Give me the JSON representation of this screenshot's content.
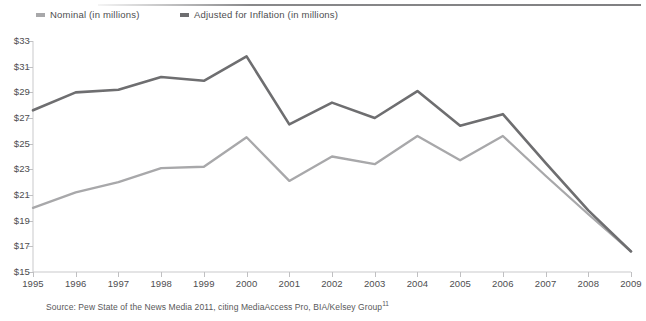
{
  "legend": {
    "items": [
      {
        "label": "Nominal (in millions)",
        "color": "#a8a8aa",
        "key": "nominal"
      },
      {
        "label": "Adjusted for Inflation (in millions)",
        "color": "#6e6e70",
        "key": "adjusted"
      }
    ]
  },
  "source": {
    "text": "Source: Pew State of the News Media 2011, citing MediaAccess Pro, BIA/Kelsey Group",
    "footnote_marker": "11"
  },
  "chart_data": {
    "type": "line",
    "title": "",
    "subtitle": "",
    "xlabel": "",
    "ylabel": "",
    "x": [
      1995,
      1996,
      1997,
      1998,
      1999,
      2000,
      2001,
      2002,
      2003,
      2004,
      2005,
      2006,
      2007,
      2008,
      2009
    ],
    "categories": [
      "1995",
      "1996",
      "1997",
      "1998",
      "1999",
      "2000",
      "2001",
      "2002",
      "2003",
      "2004",
      "2005",
      "2006",
      "2007",
      "2008",
      "2009"
    ],
    "xlim": [
      1995,
      2009
    ],
    "ylim": [
      15,
      33
    ],
    "ytick_values": [
      15,
      17,
      19,
      21,
      23,
      25,
      27,
      29,
      31,
      33
    ],
    "ytick_labels": [
      "$15",
      "$17",
      "$19",
      "$21",
      "$23",
      "$25",
      "$27",
      "$29",
      "$31",
      "$33"
    ],
    "grid": false,
    "legend_position": "top-left",
    "series": [
      {
        "name": "Nominal (in millions)",
        "color": "#a8a8aa",
        "values": [
          20.0,
          21.2,
          22.0,
          23.1,
          23.2,
          25.5,
          22.1,
          24.0,
          23.4,
          25.6,
          23.7,
          25.6,
          22.5,
          19.5,
          16.6
        ]
      },
      {
        "name": "Adjusted for Inflation (in millions)",
        "color": "#6e6e70",
        "values": [
          27.6,
          29.0,
          29.2,
          30.2,
          29.9,
          31.8,
          26.5,
          28.2,
          27.0,
          29.1,
          26.4,
          27.3,
          23.5,
          19.8,
          16.6
        ]
      }
    ]
  }
}
